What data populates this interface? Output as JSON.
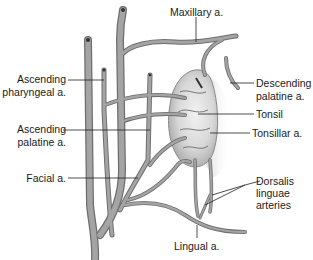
{
  "diagram": {
    "colors": {
      "vessel_fill": "#9a9a9a",
      "vessel_edge": "#6e6e6e",
      "tonsil_fill": "#d9d9d9",
      "leader_line": "#222222",
      "text": "#1a1a1a"
    },
    "labels": {
      "maxillary": "Maxillary a.",
      "ascending_pharyngeal_1": "Ascending",
      "ascending_pharyngeal_2": "pharyngeal a.",
      "descending_palatine_1": "Descending",
      "descending_palatine_2": "palatine a.",
      "tonsil": "Tonsil",
      "ascending_palatine_1": "Ascending",
      "ascending_palatine_2": "palatine  a.",
      "tonsillar": "Tonsillar a.",
      "facial": "Facial a.",
      "dorsalis_1": "Dorsalis",
      "dorsalis_2": "linguae",
      "dorsalis_3": "arteries",
      "lingual": "Lingual a."
    }
  }
}
